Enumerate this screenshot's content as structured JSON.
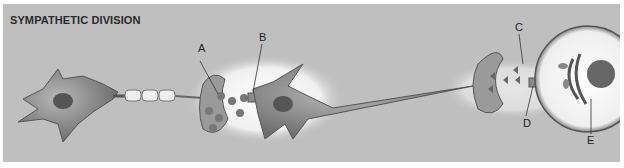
{
  "diagram": {
    "title": "SYMPATHETIC DIVISION",
    "labels": {
      "A": "A",
      "B": "B",
      "C": "C",
      "D": "D",
      "E": "E"
    },
    "colors": {
      "background": "#bfbfbf",
      "highlight": "#f2f2f2",
      "cell": "#8a8a8a",
      "text": "#222222"
    }
  }
}
